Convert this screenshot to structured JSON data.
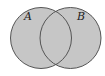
{
  "diagram": {
    "type": "venn",
    "sets": [
      {
        "label": "A",
        "cx": 41,
        "cy": 38,
        "r": 30.5
      },
      {
        "label": "B",
        "cx": 70.5,
        "cy": 38,
        "r": 30.5
      }
    ],
    "colors": {
      "fill": "#c6c6c6",
      "stroke": "#555555",
      "background": "#ffffff"
    },
    "shaded_region": "A ∪ B"
  }
}
